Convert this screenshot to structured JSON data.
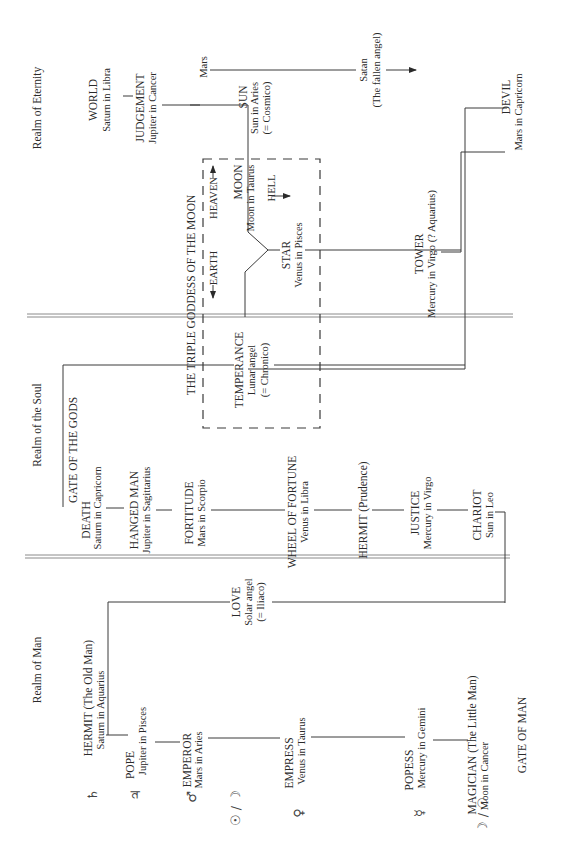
{
  "realms": {
    "eternity": "Realm of Eternity",
    "soul": "Realm of the Soul",
    "man": "Realm of Man"
  },
  "gates": {
    "gods": "GATE OF THE GODS",
    "man": "GATE OF MAN"
  },
  "triple_goddess": {
    "title": "THE TRIPLE GODDESS OF THE MOON",
    "earth": "EARTH",
    "heaven": "HEAVEN",
    "hell": "HELL"
  },
  "cards": {
    "world": {
      "name": "WORLD",
      "sub": "Saturn in Libra"
    },
    "judgement": {
      "name": "JUDGEMENT",
      "sub": "Jupiter in Cancer"
    },
    "mars_label": "Mars",
    "sun": {
      "name": "SUN",
      "sub": "Sun in Aries",
      "note": "(= Cosmico)"
    },
    "satan": {
      "name": "Satan",
      "note": "(The fallen angel)"
    },
    "devil": {
      "name": "DEVIL",
      "sub": "Mars in Capricorn"
    },
    "moon": {
      "name": "MOON",
      "sub": "Moon in Taurus"
    },
    "star": {
      "name": "STAR",
      "sub": "Venus in Pisces"
    },
    "tower": {
      "name": "TOWER",
      "sub": "Mercury in Virgo (? Aquarius)"
    },
    "temperance": {
      "name": "TEMPERANCE",
      "sub": "Lunar angel",
      "note": "(= Chronico)"
    },
    "death": {
      "name": "DEATH",
      "sub": "Saturn in Capricorn"
    },
    "hanged_man": {
      "name": "HANGED MAN",
      "sub": "Jupiter in Sagittarius"
    },
    "fortitude": {
      "name": "FORTITUDE",
      "sub": "Mars in Scorpio"
    },
    "wheel": {
      "name": "WHEEL OF FORTUNE",
      "sub": "Venus in Libra"
    },
    "hermit_prudence": {
      "name": "HERMIT (Prudence)"
    },
    "justice": {
      "name": "JUSTICE",
      "sub": "Mercury in Virgo"
    },
    "chariot": {
      "name": "CHARIOT",
      "sub": "Sun in Leo"
    },
    "love": {
      "name": "LOVE",
      "sub": "Solar angel",
      "note": "(= Iliaco)"
    },
    "hermit_old": {
      "name": "HERMIT (The Old Man)",
      "sub": "Saturn in Aquarius"
    },
    "pope": {
      "name": "POPE",
      "sub": "Jupiter in Pisces"
    },
    "emperor": {
      "name": "EMPEROR",
      "sub": "Mars in Aries"
    },
    "empress": {
      "name": "EMPRESS",
      "sub": "Venus in Taurus"
    },
    "popess": {
      "name": "POPESS",
      "sub": "Mercury in Gemini"
    },
    "magician": {
      "name": "MAGICIAN (The Little Man)",
      "sub": "Moon in Cancer"
    }
  },
  "planet_symbols": {
    "saturn": "♄",
    "jupiter": "♃",
    "mars": "♂",
    "sun_moon": "☉ / ☽",
    "venus": "♀",
    "mercury": "☿",
    "moon_sun": "☽ / ☉"
  }
}
